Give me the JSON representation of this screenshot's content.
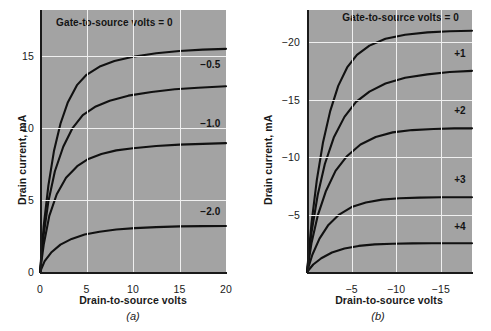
{
  "figure": {
    "caption_a": "(a)",
    "caption_b": "(b)"
  },
  "chart_data": [
    {
      "id": "panel-a",
      "type": "line",
      "title": "",
      "caption": "(a)",
      "xlabel": "Drain-to-source volts",
      "ylabel": "Drain current, mA",
      "xlim": [
        0,
        20
      ],
      "ylim": [
        0,
        18.2
      ],
      "xticks": [
        0,
        5,
        10,
        15,
        20
      ],
      "xticklabels": [
        "0",
        "5",
        "10",
        "15",
        "20"
      ],
      "yticks": [
        0,
        5,
        10,
        15
      ],
      "yticklabels": [
        "0",
        "5",
        "10",
        "15"
      ],
      "grid": true,
      "grid_color": "#f0f0f0",
      "plot_bgcolor": "#a3a3a3",
      "curve_color": "#111111",
      "annotation": "Gate-to-source volts = 0",
      "series": [
        {
          "name": "0",
          "label": "Gate-to-source volts = 0",
          "idss": 15.5,
          "vp": 4.2,
          "points": [
            [
              0,
              0
            ],
            [
              0.4,
              3.2
            ],
            [
              0.9,
              6.0
            ],
            [
              1.5,
              8.4
            ],
            [
              2.2,
              10.3
            ],
            [
              3.0,
              11.8
            ],
            [
              4.0,
              13.0
            ],
            [
              5.0,
              13.7
            ],
            [
              6.5,
              14.3
            ],
            [
              8.0,
              14.65
            ],
            [
              10.0,
              14.95
            ],
            [
              12.5,
              15.2
            ],
            [
              15.0,
              15.35
            ],
            [
              17.5,
              15.45
            ],
            [
              20.0,
              15.5
            ]
          ]
        },
        {
          "name": "-0.5",
          "label": "−0.5",
          "idss": 12.9,
          "vp": 5.5,
          "points": [
            [
              0,
              0
            ],
            [
              0.4,
              2.6
            ],
            [
              0.9,
              4.9
            ],
            [
              1.6,
              7.0
            ],
            [
              2.5,
              8.7
            ],
            [
              3.5,
              10.0
            ],
            [
              4.6,
              10.9
            ],
            [
              6.0,
              11.5
            ],
            [
              7.5,
              11.9
            ],
            [
              9.5,
              12.25
            ],
            [
              12.0,
              12.5
            ],
            [
              14.5,
              12.7
            ],
            [
              17.0,
              12.8
            ],
            [
              20.0,
              12.9
            ]
          ]
        },
        {
          "name": "-1.0",
          "label": "−1.0",
          "idss": 8.95,
          "vp": 6.5,
          "points": [
            [
              0,
              0
            ],
            [
              0.4,
              1.9
            ],
            [
              1.0,
              3.9
            ],
            [
              1.8,
              5.4
            ],
            [
              2.8,
              6.55
            ],
            [
              4.0,
              7.35
            ],
            [
              5.2,
              7.85
            ],
            [
              6.6,
              8.2
            ],
            [
              8.2,
              8.45
            ],
            [
              10.0,
              8.6
            ],
            [
              12.5,
              8.75
            ],
            [
              15.0,
              8.85
            ],
            [
              17.5,
              8.9
            ],
            [
              20.0,
              8.95
            ]
          ]
        },
        {
          "name": "-2.0",
          "label": "−2.0",
          "idss": 3.2,
          "vp": 9.5,
          "points": [
            [
              0,
              0
            ],
            [
              0.5,
              0.75
            ],
            [
              1.2,
              1.35
            ],
            [
              2.2,
              1.9
            ],
            [
              3.4,
              2.3
            ],
            [
              4.8,
              2.6
            ],
            [
              6.4,
              2.8
            ],
            [
              8.2,
              2.95
            ],
            [
              10.2,
              3.05
            ],
            [
              12.5,
              3.12
            ],
            [
              15.0,
              3.17
            ],
            [
              17.5,
              3.19
            ],
            [
              20.0,
              3.2
            ]
          ]
        }
      ],
      "curve_labels": [
        {
          "text": "Gate-to-source volts = 0",
          "x": 8.0,
          "y": 17.2
        },
        {
          "text": "−0.5",
          "x": 19.4,
          "y": 14.3
        },
        {
          "text": "−1.0",
          "x": 19.4,
          "y": 10.2
        },
        {
          "text": "−2.0",
          "x": 19.4,
          "y": 4.1
        }
      ]
    },
    {
      "id": "panel-b",
      "type": "line",
      "title": "",
      "caption": "(b)",
      "xlabel": "Drain-to-source volts",
      "ylabel": "Drain current, mA",
      "xlim": [
        0,
        -18.5
      ],
      "ylim": [
        0,
        -22.8
      ],
      "xticks": [
        -5,
        -10,
        -15
      ],
      "xticklabels": [
        "−5",
        "−10",
        "−15"
      ],
      "yticks": [
        -5,
        -10,
        -15,
        -20
      ],
      "yticklabels": [
        "−5",
        "−10",
        "−15",
        "−20"
      ],
      "grid": true,
      "grid_color": "#f0f0f0",
      "plot_bgcolor": "#a3a3a3",
      "curve_color": "#111111",
      "annotation": "Gate-to-source volts = 0",
      "series": [
        {
          "name": "0",
          "label": "Gate-to-source volts = 0",
          "idss": -21.0,
          "vp": -5.0,
          "points": [
            [
              0,
              0
            ],
            [
              -0.5,
              -4.2
            ],
            [
              -1.1,
              -8.0
            ],
            [
              -1.8,
              -11.3
            ],
            [
              -2.6,
              -14.0
            ],
            [
              -3.5,
              -16.2
            ],
            [
              -4.5,
              -17.8
            ],
            [
              -5.6,
              -18.9
            ],
            [
              -7.0,
              -19.7
            ],
            [
              -8.8,
              -20.3
            ],
            [
              -11.0,
              -20.65
            ],
            [
              -13.5,
              -20.85
            ],
            [
              -16.0,
              -20.95
            ],
            [
              -18.5,
              -21.0
            ]
          ]
        },
        {
          "name": "+1",
          "label": "+1",
          "idss": -17.5,
          "vp": -6.2,
          "points": [
            [
              0,
              0
            ],
            [
              -0.5,
              -3.4
            ],
            [
              -1.2,
              -6.7
            ],
            [
              -2.0,
              -9.4
            ],
            [
              -3.0,
              -11.7
            ],
            [
              -4.2,
              -13.5
            ],
            [
              -5.5,
              -14.8
            ],
            [
              -7.0,
              -15.7
            ],
            [
              -8.8,
              -16.4
            ],
            [
              -11.0,
              -16.9
            ],
            [
              -13.5,
              -17.2
            ],
            [
              -16.0,
              -17.4
            ],
            [
              -18.5,
              -17.5
            ]
          ]
        },
        {
          "name": "+2",
          "label": "+2",
          "idss": -12.5,
          "vp": -7.0,
          "points": [
            [
              0,
              0
            ],
            [
              -0.5,
              -2.5
            ],
            [
              -1.2,
              -4.9
            ],
            [
              -2.1,
              -7.0
            ],
            [
              -3.2,
              -8.8
            ],
            [
              -4.5,
              -10.1
            ],
            [
              -6.0,
              -11.1
            ],
            [
              -7.7,
              -11.75
            ],
            [
              -9.6,
              -12.15
            ],
            [
              -11.8,
              -12.35
            ],
            [
              -14.2,
              -12.45
            ],
            [
              -16.5,
              -12.5
            ],
            [
              -18.5,
              -12.5
            ]
          ]
        },
        {
          "name": "+3",
          "label": "+3",
          "idss": -6.5,
          "vp": -8.5,
          "points": [
            [
              0,
              0
            ],
            [
              -0.6,
              -1.5
            ],
            [
              -1.4,
              -2.9
            ],
            [
              -2.4,
              -4.1
            ],
            [
              -3.6,
              -5.0
            ],
            [
              -5.0,
              -5.65
            ],
            [
              -6.6,
              -6.05
            ],
            [
              -8.4,
              -6.3
            ],
            [
              -10.4,
              -6.42
            ],
            [
              -12.6,
              -6.47
            ],
            [
              -15.0,
              -6.5
            ],
            [
              -18.5,
              -6.5
            ]
          ]
        },
        {
          "name": "+4",
          "label": "+4",
          "idss": -2.5,
          "vp": -10.0,
          "points": [
            [
              0,
              0
            ],
            [
              -0.7,
              -0.65
            ],
            [
              -1.6,
              -1.2
            ],
            [
              -2.8,
              -1.7
            ],
            [
              -4.2,
              -2.05
            ],
            [
              -5.8,
              -2.27
            ],
            [
              -7.6,
              -2.4
            ],
            [
              -9.6,
              -2.46
            ],
            [
              -11.8,
              -2.49
            ],
            [
              -14.0,
              -2.5
            ],
            [
              -18.5,
              -2.5
            ]
          ]
        }
      ],
      "curve_labels": [
        {
          "text": "Gate-to-source volts = 0",
          "x": -10.5,
          "y": -22.0
        },
        {
          "text": "+1",
          "x": -17.8,
          "y": -18.9
        },
        {
          "text": "+2",
          "x": -17.8,
          "y": -13.9
        },
        {
          "text": "+3",
          "x": -17.8,
          "y": -7.9
        },
        {
          "text": "+4",
          "x": -17.8,
          "y": -3.8
        }
      ]
    }
  ]
}
